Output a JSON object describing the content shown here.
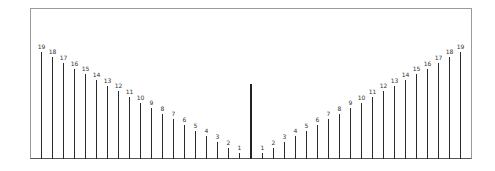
{
  "chart_data": {
    "type": "bar",
    "title": "",
    "left_series": {
      "labels": [
        "19",
        "18",
        "17",
        "16",
        "15",
        "14",
        "13",
        "12",
        "11",
        "10",
        "9",
        "8",
        "7",
        "6",
        "5",
        "4",
        "3",
        "2",
        "1"
      ],
      "values": [
        19,
        18,
        17,
        16,
        15,
        14,
        13,
        12,
        11,
        10,
        9,
        8,
        7,
        6,
        5,
        4,
        3,
        2,
        1
      ]
    },
    "center_bar": {
      "label": "",
      "value": 13.3
    },
    "right_series": {
      "labels": [
        "1",
        "2",
        "3",
        "4",
        "5",
        "6",
        "7",
        "8",
        "9",
        "10",
        "11",
        "12",
        "13",
        "14",
        "15",
        "16",
        "17",
        "18",
        "19"
      ],
      "values": [
        1,
        2,
        3,
        4,
        5,
        6,
        7,
        8,
        9,
        10,
        11,
        12,
        13,
        14,
        15,
        16,
        17,
        18,
        19
      ]
    },
    "xlabel": "",
    "ylabel": "",
    "grid": false,
    "legend": "none"
  },
  "colors": {
    "bar": "#2a2a2a",
    "frame": "#9a9a9a",
    "text": "#333333"
  }
}
